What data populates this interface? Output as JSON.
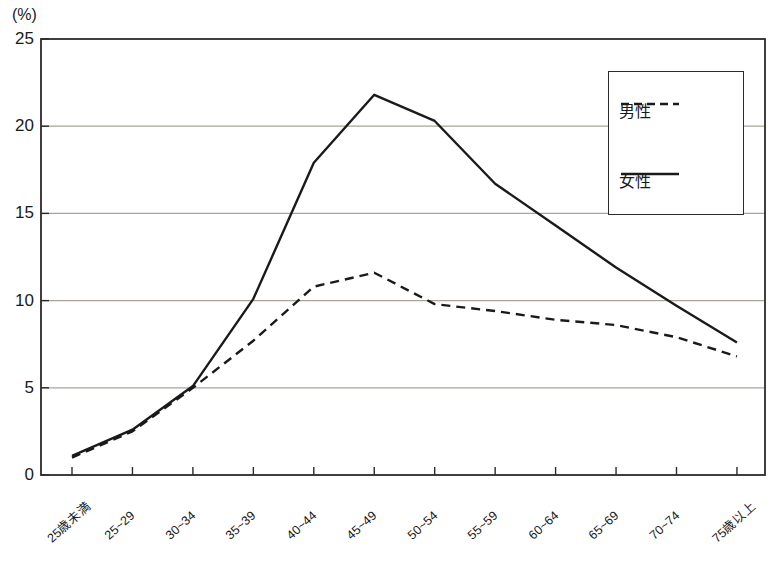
{
  "chart_data": {
    "type": "line",
    "title": "",
    "subtitle": "",
    "xlabel": "",
    "ylabel": "",
    "unit_label": "(%)",
    "ylim": [
      0,
      25
    ],
    "ytick_values": [
      0,
      5,
      10,
      15,
      20,
      25
    ],
    "ytick_labels": [
      "0",
      "5",
      "10",
      "15",
      "20",
      "25"
    ],
    "grid": true,
    "grid_orientation": "horizontal",
    "legend_position": "top-right",
    "categories": [
      "25歳未満",
      "25~29",
      "30~34",
      "35~39",
      "40~44",
      "45~49",
      "50~54",
      "55~59",
      "60~64",
      "65~69",
      "70~74",
      "75歳以上"
    ],
    "series": [
      {
        "name": "男性",
        "style": "dashed",
        "color": "#1a1a1a",
        "values": [
          1.0,
          2.5,
          5.0,
          7.7,
          10.8,
          11.6,
          9.8,
          9.4,
          8.9,
          8.6,
          7.9,
          6.8
        ]
      },
      {
        "name": "女性",
        "style": "solid",
        "color": "#1a1a1a",
        "values": [
          1.1,
          2.6,
          5.1,
          10.1,
          17.9,
          21.8,
          20.3,
          16.7,
          14.3,
          11.9,
          9.7,
          7.6
        ]
      }
    ]
  },
  "legend": {
    "items": [
      {
        "label": "男性",
        "style": "dashed"
      },
      {
        "label": "女性",
        "style": "solid"
      }
    ]
  },
  "colors": {
    "axis": "#2b2b2b",
    "grid": "#a8a49a",
    "line": "#1a1a1a",
    "text": "#1a1a1a",
    "background": "#ffffff"
  }
}
